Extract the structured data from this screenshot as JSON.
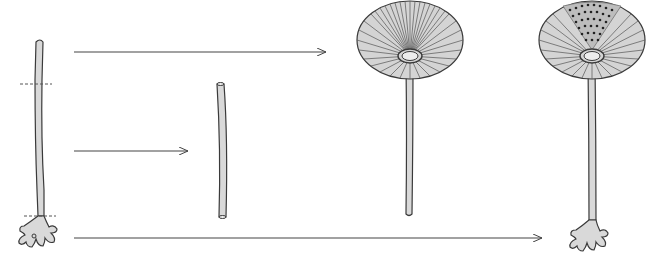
{
  "diagram": {
    "colors": {
      "background": "#ffffff",
      "cell_fill": "#d9d9d9",
      "outline": "#3a3a3a",
      "arrow": "#444444",
      "cut_line": "#555555",
      "dots": "#222222"
    },
    "stages": [
      {
        "id": "intact-stalk",
        "label": "",
        "cuts": 2
      },
      {
        "id": "mid-segment",
        "label": ""
      },
      {
        "id": "regenerated-cap-top",
        "label": ""
      },
      {
        "id": "regenerated-whole",
        "label": ""
      }
    ],
    "arrows": [
      {
        "from": "top-segment",
        "to": "cap-without-rhizoid"
      },
      {
        "from": "middle-segment",
        "to": "isolated-stalk"
      },
      {
        "from": "rhizoid-segment",
        "to": "whole-regenerated-cell"
      }
    ]
  }
}
